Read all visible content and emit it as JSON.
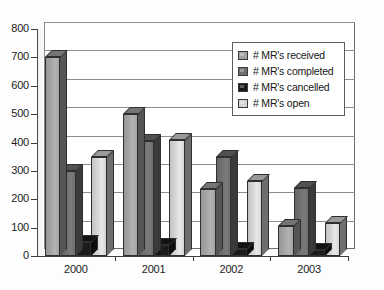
{
  "chart_data": {
    "type": "bar",
    "title": "",
    "subtitle": "",
    "xlabel": "",
    "ylabel": "",
    "categories": [
      "2000",
      "2001",
      "2002",
      "2003"
    ],
    "series": [
      {
        "name": "# MR's received",
        "color": "#a3a3a3",
        "values": [
          700,
          500,
          235,
          105
        ]
      },
      {
        "name": "# MR's completed",
        "color": "#6f6f6f",
        "values": [
          300,
          405,
          350,
          240
        ]
      },
      {
        "name": "# MR's cancelled",
        "color": "#191919",
        "values": [
          50,
          40,
          25,
          20
        ]
      },
      {
        "name": "# MR's open",
        "color": "#d4d4d4",
        "values": [
          350,
          410,
          265,
          115
        ]
      }
    ],
    "ylim": [
      0,
      800
    ],
    "ytick_step": 100,
    "yticks": [
      0,
      100,
      200,
      300,
      400,
      500,
      600,
      700,
      800
    ],
    "grid": true,
    "grid_axis": "y",
    "legend": true,
    "legend_position": "upper right",
    "style": "3d-clustered-column",
    "background": "#ffffff"
  },
  "axes": {
    "y_tick_labels": [
      "800",
      "700",
      "600",
      "500",
      "400",
      "300",
      "200",
      "100",
      "0"
    ],
    "x_tick_labels": [
      "2000",
      "2001",
      "2002",
      "2003"
    ]
  },
  "legend_items": [
    {
      "label": "# MR's received",
      "swatch_color": "#a3a3a3"
    },
    {
      "label": "# MR's completed",
      "swatch_color": "#6f6f6f"
    },
    {
      "label": "# MR's cancelled",
      "swatch_color": "#191919"
    },
    {
      "label": "# MR's open",
      "swatch_color": "#d4d4d4"
    }
  ]
}
